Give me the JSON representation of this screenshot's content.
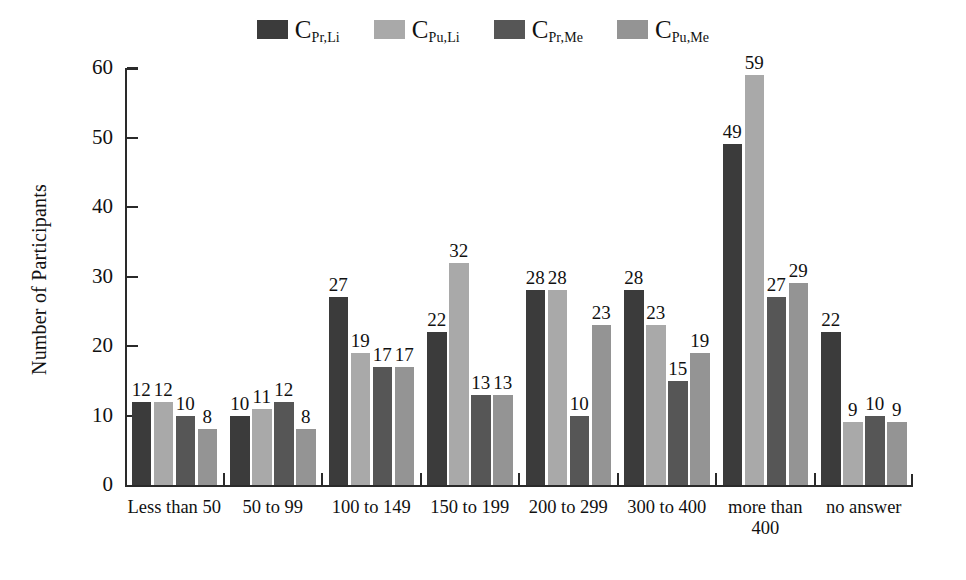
{
  "chart_data": {
    "type": "bar",
    "title": "",
    "xlabel": "",
    "ylabel": "Number of Participants",
    "ylim": [
      0,
      60
    ],
    "ytick_labels": [
      "0",
      "10",
      "20",
      "30",
      "40",
      "50",
      "60"
    ],
    "grid": false,
    "legend_position": "top-center",
    "categories": [
      "Less than 50",
      "50 to 99",
      "100 to 149",
      "150 to 199",
      "200 to 299",
      "300 to 400",
      "more than 400",
      "no answer"
    ],
    "category_lines": [
      [
        "Less than 50"
      ],
      [
        "50 to 99"
      ],
      [
        "100 to 149"
      ],
      [
        "150 to 199"
      ],
      [
        "200 to 299"
      ],
      [
        "300 to 400"
      ],
      [
        "more than",
        "400"
      ],
      [
        "no answer"
      ]
    ],
    "series": [
      {
        "name": "C_Pr,Li",
        "label_main": "C",
        "label_sub": "Pr,Li",
        "color": "#3b3b3b",
        "values": [
          12,
          10,
          27,
          22,
          28,
          28,
          49,
          22
        ]
      },
      {
        "name": "C_Pu,Li",
        "label_main": "C",
        "label_sub": "Pu,Li",
        "color": "#a9a9a9",
        "values": [
          12,
          11,
          19,
          32,
          28,
          23,
          59,
          9
        ]
      },
      {
        "name": "C_Pr,Me",
        "label_main": "C",
        "label_sub": "Pr,Me",
        "color": "#565656",
        "values": [
          10,
          12,
          17,
          13,
          10,
          15,
          27,
          10
        ]
      },
      {
        "name": "C_Pu,Me",
        "label_main": "C",
        "label_sub": "Pu,Me",
        "color": "#949494",
        "values": [
          8,
          8,
          17,
          13,
          23,
          19,
          29,
          9
        ]
      }
    ]
  }
}
